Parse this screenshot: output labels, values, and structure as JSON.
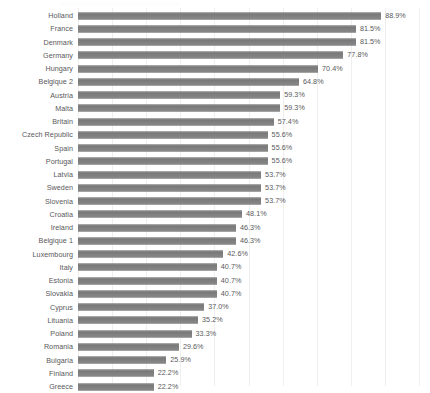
{
  "chart_data": {
    "type": "bar",
    "orientation": "horizontal",
    "title": "",
    "subtitle": "",
    "xlabel": "",
    "ylabel": "",
    "xlim": [
      0,
      100
    ],
    "grid": true,
    "gridline_step": 10,
    "legend": "none",
    "value_suffix": "%",
    "bar_color": "#7f7f7f",
    "text_color": "#58585a",
    "gridline_color": "#efefef",
    "background_color": "#ffffff",
    "categories": [
      "Holland",
      "France",
      "Denmark",
      "Germany",
      "Hungary",
      "Belgique 2",
      "Austria",
      "Malta",
      "Britain",
      "Czech Republic",
      "Spain",
      "Portugal",
      "Latvia",
      "Sweden",
      "Slovenia",
      "Croatia",
      "Ireland",
      "Belgique 1",
      "Luxembourg",
      "Italy",
      "Estonia",
      "Slovakia",
      "Cyprus",
      "Lituania",
      "Poland",
      "Romania",
      "Bulgaria",
      "Finland",
      "Greece"
    ],
    "values": [
      88.9,
      81.5,
      81.5,
      77.8,
      70.4,
      64.8,
      59.3,
      59.3,
      57.4,
      55.6,
      55.6,
      55.6,
      53.7,
      53.7,
      53.7,
      48.1,
      46.3,
      46.3,
      42.6,
      40.7,
      40.7,
      40.7,
      37.0,
      35.2,
      33.3,
      29.6,
      25.9,
      22.2,
      22.2
    ],
    "value_labels": [
      "88.9%",
      "81.5%",
      "81.5%",
      "77.8%",
      "70.4%",
      "64.8%",
      "59.3%",
      "59.3%",
      "57.4%",
      "55.6%",
      "55.6%",
      "55.6%",
      "53.7%",
      "53.7%",
      "53.7%",
      "48.1%",
      "46.3%",
      "46.3%",
      "42.6%",
      "40.7%",
      "40.7%",
      "40.7%",
      "37.0%",
      "35.2%",
      "33.3%",
      "29.6%",
      "25.9%",
      "22.2%",
      "22.2%"
    ]
  }
}
